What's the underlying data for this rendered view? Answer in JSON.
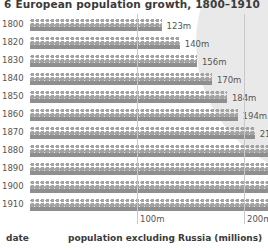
{
  "title": {
    "number": "6",
    "text": "European population growth, 1800–1910"
  },
  "footer": {
    "date_label": "date",
    "legend_label": "population excluding Russia (millions)"
  },
  "axis": {
    "ticks": [
      {
        "label": "100m",
        "value": 100
      },
      {
        "label": "200m",
        "value": 200
      }
    ]
  },
  "chart_data": {
    "type": "bar",
    "title": "European population growth, 1800–1910",
    "xlabel": "population excluding Russia (millions)",
    "ylabel": "date",
    "categories": [
      "1800",
      "1820",
      "1830",
      "1840",
      "1850",
      "1860",
      "1870",
      "1880",
      "1890",
      "1900",
      "1910"
    ],
    "values": [
      123,
      140,
      156,
      170,
      184,
      194,
      210,
      225,
      244,
      267,
      294
    ],
    "value_labels": [
      "123m",
      "140m",
      "156m",
      "170m",
      "184m",
      "194m",
      "210m",
      "225m",
      "244m",
      "267m",
      "294m"
    ],
    "xlim": [
      0,
      310
    ],
    "xticks": [
      100,
      200
    ],
    "xtick_labels": [
      "100m",
      "200m"
    ],
    "grid": true,
    "legend": "none",
    "pictogram": true,
    "pictogram_unit": "people-icon"
  },
  "colors": {
    "bar_base": "#8f8f8f",
    "pictogram": "#a3a3a3",
    "gridline": "#c9c9c9",
    "text": "#555555",
    "heading": "#3b3b3b",
    "decoration": "#e9e9e9",
    "background": "#ffffff"
  }
}
